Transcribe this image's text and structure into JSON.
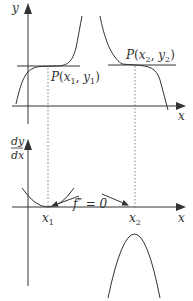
{
  "diagram": {
    "top_graph": {
      "y_axis_label": "y",
      "x_axis_label": "x",
      "point1": {
        "label_prefix": "P(",
        "x": "x",
        "x_sub": "1",
        "sep": ", ",
        "y": "y",
        "y_sub": "1",
        "suffix": ")"
      },
      "point2": {
        "label_prefix": "P(",
        "x": "x",
        "x_sub": "2",
        "sep": ", ",
        "y": "y",
        "y_sub": "2",
        "suffix": ")"
      }
    },
    "bottom_graph": {
      "y_axis_label_num": "dy",
      "y_axis_label_den": "dx",
      "x_axis_label": "x",
      "root1": {
        "x": "x",
        "sub": "1"
      },
      "root2": {
        "x": "x",
        "sub": "2"
      },
      "annotation": "f″ = 0"
    },
    "colors": {
      "line": "#333333",
      "background": "#ffffff"
    }
  }
}
